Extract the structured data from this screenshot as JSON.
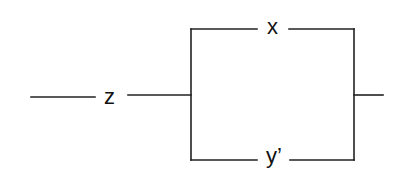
{
  "diagram": {
    "type": "switching-circuit",
    "labels": {
      "series_switch": "z",
      "top_branch_switch": "x",
      "bottom_branch_switch": "y’"
    },
    "colors": {
      "line": "#222222",
      "text": "#111111",
      "background": "#ffffff"
    },
    "structure": {
      "series": [
        "z"
      ],
      "parallel": [
        "x",
        "y’"
      ]
    }
  }
}
